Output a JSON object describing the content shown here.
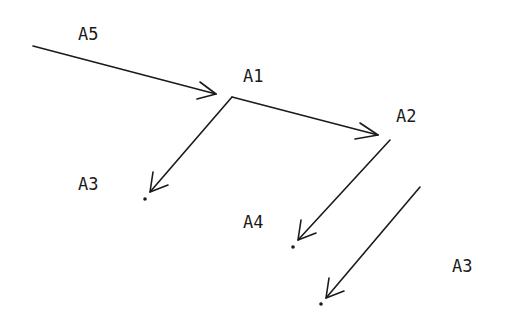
{
  "diagram": {
    "type": "flow-arrows",
    "background": "#ffffff",
    "ink": "#1a1a1a",
    "labels": [
      {
        "id": "a5",
        "text": "A5",
        "x": 78,
        "y": 40
      },
      {
        "id": "a1",
        "text": "A1",
        "x": 243,
        "y": 82
      },
      {
        "id": "a2",
        "text": "A2",
        "x": 396,
        "y": 122
      },
      {
        "id": "a3-left",
        "text": "A3",
        "x": 78,
        "y": 190
      },
      {
        "id": "a4",
        "text": "A4",
        "x": 243,
        "y": 228
      },
      {
        "id": "a3-right",
        "text": "A3",
        "x": 452,
        "y": 272
      }
    ],
    "arrows": [
      {
        "id": "a5-to-a1",
        "from": [
          33,
          46
        ],
        "to": [
          216,
          94
        ]
      },
      {
        "id": "a1-to-a2",
        "from": [
          232,
          97
        ],
        "to": [
          378,
          135
        ]
      },
      {
        "id": "a1-to-a3",
        "from": [
          232,
          97
        ],
        "to": [
          150,
          192
        ]
      },
      {
        "id": "a2-to-a4",
        "from": [
          390,
          140
        ],
        "to": [
          298,
          240
        ]
      },
      {
        "id": "a2-to-a3",
        "from": [
          420,
          187
        ],
        "to": [
          326,
          298
        ]
      }
    ],
    "dots": [
      {
        "id": "dot-a3-left",
        "x": 145,
        "y": 199
      },
      {
        "id": "dot-a4",
        "x": 293,
        "y": 247
      },
      {
        "id": "dot-a3-right",
        "x": 321,
        "y": 304
      }
    ]
  }
}
